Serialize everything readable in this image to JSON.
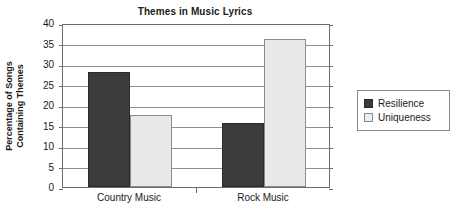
{
  "chart_data": {
    "type": "bar",
    "title": "Themes in Music Lyrics",
    "xlabel": "",
    "ylabel": "Percentage of Songs Containing Themes",
    "ylabel_lines": [
      "Percentage of Songs",
      "Containing Themes"
    ],
    "categories": [
      "Country Music",
      "Rock Music"
    ],
    "series": [
      {
        "name": "Resilience",
        "values": [
          28,
          15.5
        ],
        "color": "#3b3b3b"
      },
      {
        "name": "Uniqueness",
        "values": [
          17.5,
          36
        ],
        "color": "#e9e9e9"
      }
    ],
    "ylim": [
      0,
      40
    ],
    "yticks": [
      0,
      5,
      10,
      15,
      20,
      25,
      30,
      35,
      40
    ],
    "ytick_labels": [
      "0",
      "5",
      "10",
      "15",
      "20",
      "25",
      "30",
      "35",
      "40"
    ],
    "grid": true,
    "legend_position": "right"
  },
  "legend": {
    "entries": [
      {
        "label": "Resilience",
        "swatch": "dark"
      },
      {
        "label": "Uniqueness",
        "swatch": "light"
      }
    ]
  }
}
